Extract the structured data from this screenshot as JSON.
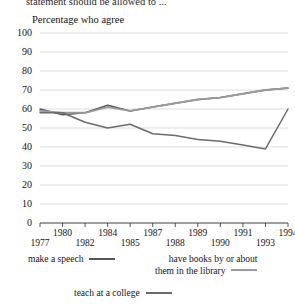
{
  "cut_off_header": "statement should be allowed to ...",
  "axis_caption": "Percentage who agree",
  "legend": {
    "items": [
      {
        "name": "legend-make-a-speech",
        "label": "make a speech",
        "color": "#555555"
      },
      {
        "name": "legend-have-books",
        "label_line1": "have books by or about",
        "label_line2": "them in the library",
        "color": "#9a9a9a"
      },
      {
        "name": "legend-teach-college",
        "label": "teach at a college",
        "color": "#6b6b6b"
      }
    ]
  },
  "chart_data": {
    "type": "line",
    "title": "Percentage who agree",
    "xlabel": "",
    "ylabel": "",
    "ylim": [
      0,
      100
    ],
    "ytick_step": 10,
    "yticks": [
      "0",
      "10",
      "20",
      "30",
      "40",
      "50",
      "60",
      "70",
      "80",
      "90",
      "100"
    ],
    "grid": true,
    "legend_position": "below",
    "x": [
      "1977",
      "1980",
      "1982",
      "1984",
      "1985",
      "1987",
      "1988",
      "1989",
      "1990",
      "1991",
      "1993",
      "1994"
    ],
    "xticks_upper": [
      "1980",
      "1984",
      "1987",
      "1989",
      "1991",
      "1994"
    ],
    "xticks_lower": [
      "1977",
      "1982",
      "1985",
      "1988",
      "1990",
      "1993"
    ],
    "series": [
      {
        "name": "make a speech",
        "color": "#555555",
        "values": [
          60,
          57,
          58,
          62,
          59,
          61,
          63,
          65,
          66,
          68,
          70,
          71
        ]
      },
      {
        "name": "have books by or about them in the library",
        "color": "#9a9a9a",
        "values": [
          59,
          58,
          58,
          61,
          59,
          61,
          63,
          65,
          66,
          68,
          70,
          71
        ]
      },
      {
        "name": "teach at a college",
        "color": "#6b6b6b",
        "values": [
          58,
          58,
          53,
          50,
          52,
          47,
          46,
          44,
          43,
          41,
          39,
          60
        ]
      }
    ]
  }
}
